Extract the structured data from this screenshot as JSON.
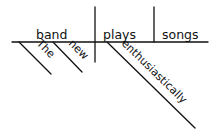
{
  "diagram": {
    "type": "sentence-diagram",
    "sentence_parts": {
      "subject": "band",
      "verb": "plays",
      "object": "songs"
    },
    "modifiers": [
      {
        "word": "The",
        "modifies": "band"
      },
      {
        "word": "new",
        "modifies": "band"
      },
      {
        "word": "enthusiastically",
        "modifies": "plays"
      }
    ],
    "colors": {
      "ink": "#111111",
      "background": "#ffffff"
    }
  }
}
